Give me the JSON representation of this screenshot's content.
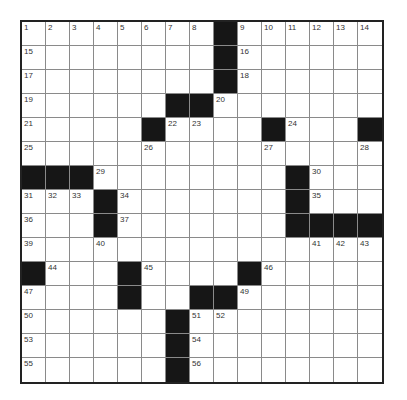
{
  "puzzle": {
    "rows": 15,
    "cols": 15,
    "colors": {
      "black": "#161616",
      "white": "#ffffff",
      "border": "#222222",
      "gridline": "#8a8a8a",
      "number": "#333333"
    },
    "layout": [
      "........#......",
      "........#......",
      "........#......",
      "......##.......",
      ".....#....#...#",
      "...............",
      "###........#...",
      "...#.......#...",
      "...#.......####",
      "...............",
      "#...#....#.....",
      "....#..##......",
      "......#........",
      "......#........",
      "......#........"
    ],
    "numbers": [
      {
        "r": 0,
        "c": 0,
        "n": "1"
      },
      {
        "r": 0,
        "c": 1,
        "n": "2"
      },
      {
        "r": 0,
        "c": 2,
        "n": "3"
      },
      {
        "r": 0,
        "c": 3,
        "n": "4"
      },
      {
        "r": 0,
        "c": 4,
        "n": "5"
      },
      {
        "r": 0,
        "c": 5,
        "n": "6"
      },
      {
        "r": 0,
        "c": 6,
        "n": "7"
      },
      {
        "r": 0,
        "c": 7,
        "n": "8"
      },
      {
        "r": 0,
        "c": 9,
        "n": "9"
      },
      {
        "r": 0,
        "c": 10,
        "n": "10"
      },
      {
        "r": 0,
        "c": 11,
        "n": "11"
      },
      {
        "r": 0,
        "c": 12,
        "n": "12"
      },
      {
        "r": 0,
        "c": 13,
        "n": "13"
      },
      {
        "r": 0,
        "c": 14,
        "n": "14"
      },
      {
        "r": 1,
        "c": 0,
        "n": "15"
      },
      {
        "r": 1,
        "c": 9,
        "n": "16"
      },
      {
        "r": 2,
        "c": 0,
        "n": "17"
      },
      {
        "r": 2,
        "c": 9,
        "n": "18"
      },
      {
        "r": 3,
        "c": 0,
        "n": "19"
      },
      {
        "r": 3,
        "c": 8,
        "n": "20"
      },
      {
        "r": 4,
        "c": 0,
        "n": "21"
      },
      {
        "r": 4,
        "c": 6,
        "n": "22"
      },
      {
        "r": 4,
        "c": 7,
        "n": "23"
      },
      {
        "r": 4,
        "c": 11,
        "n": "24"
      },
      {
        "r": 5,
        "c": 0,
        "n": "25"
      },
      {
        "r": 5,
        "c": 5,
        "n": "26"
      },
      {
        "r": 5,
        "c": 10,
        "n": "27"
      },
      {
        "r": 5,
        "c": 14,
        "n": "28"
      },
      {
        "r": 6,
        "c": 3,
        "n": "29"
      },
      {
        "r": 6,
        "c": 12,
        "n": "30"
      },
      {
        "r": 7,
        "c": 0,
        "n": "31"
      },
      {
        "r": 7,
        "c": 1,
        "n": "32"
      },
      {
        "r": 7,
        "c": 2,
        "n": "33"
      },
      {
        "r": 7,
        "c": 4,
        "n": "34"
      },
      {
        "r": 7,
        "c": 12,
        "n": "35"
      },
      {
        "r": 8,
        "c": 0,
        "n": "36"
      },
      {
        "r": 8,
        "c": 4,
        "n": "37"
      },
      {
        "r": 8,
        "c": 11,
        "n": "38"
      },
      {
        "r": 9,
        "c": 0,
        "n": "39"
      },
      {
        "r": 9,
        "c": 3,
        "n": "40"
      },
      {
        "r": 9,
        "c": 12,
        "n": "41"
      },
      {
        "r": 9,
        "c": 13,
        "n": "42"
      },
      {
        "r": 9,
        "c": 14,
        "n": "43"
      },
      {
        "r": 10,
        "c": 1,
        "n": "44"
      },
      {
        "r": 10,
        "c": 5,
        "n": "45"
      },
      {
        "r": 10,
        "c": 10,
        "n": "46"
      },
      {
        "r": 11,
        "c": 0,
        "n": "47"
      },
      {
        "r": 11,
        "c": 4,
        "n": "48"
      },
      {
        "r": 11,
        "c": 9,
        "n": "49"
      },
      {
        "r": 12,
        "c": 0,
        "n": "50"
      },
      {
        "r": 12,
        "c": 7,
        "n": "51"
      },
      {
        "r": 12,
        "c": 8,
        "n": "52"
      },
      {
        "r": 13,
        "c": 0,
        "n": "53"
      },
      {
        "r": 13,
        "c": 7,
        "n": "54"
      },
      {
        "r": 14,
        "c": 0,
        "n": "55"
      },
      {
        "r": 14,
        "c": 7,
        "n": "56"
      }
    ]
  }
}
